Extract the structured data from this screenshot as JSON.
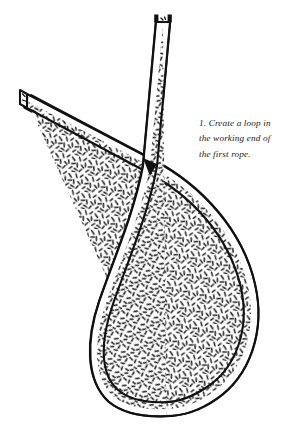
{
  "figure": {
    "style": "line-art-hatched",
    "colors": {
      "outline": "#111111",
      "fill": "#ffffff",
      "hatch": "#111111",
      "background": "#ffffff",
      "text": "#1a1a1a"
    },
    "rope_width": 14,
    "outline_width": 2.1,
    "parts": [
      {
        "name": "standing-part",
        "description": "rope entering from upper left with cut end, passing behind the working end at the crossing, then sweeping down into the right side of the loop",
        "end_cap": "plain-cut",
        "end_point": [
          22,
          97
        ],
        "z": "behind"
      },
      {
        "name": "working-end",
        "description": "rope descending from the top with a whipped cut end, passing in front at the crossing, then curving into the left side and bottom of the loop",
        "end_cap": "whipped",
        "end_point": [
          163,
          16
        ],
        "z": "front"
      }
    ],
    "crossing_point": [
      150,
      166
    ],
    "loop_bottom": [
      178,
      410
    ]
  },
  "caption": {
    "number": "1.",
    "lines": [
      "1. Create a loop in",
      "the working end of",
      "the first rope."
    ],
    "full_text": "1. Create a loop in the working end of the first rope."
  }
}
